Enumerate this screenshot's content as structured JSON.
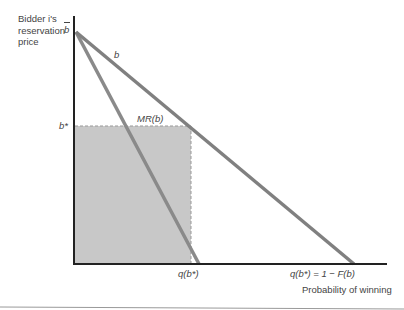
{
  "diagram": {
    "type": "economics-auction-diagram",
    "y_axis_label": "Bidder i's reservation price",
    "x_axis_label": "Probability of winning",
    "labels": {
      "b_bar": "b",
      "b_line": "b",
      "mr_line": "MR(b)",
      "b_star": "b*",
      "q_b_star": "q(b*)",
      "q_full": "q(b*) = 1 − F(b)"
    },
    "colors": {
      "axis": "#222222",
      "demand_line": "#808080",
      "mr_line": "#8a8a8a",
      "shaded_area": "#c8c8c8",
      "dashed_edge": "#999999",
      "rule": "#999999"
    }
  }
}
